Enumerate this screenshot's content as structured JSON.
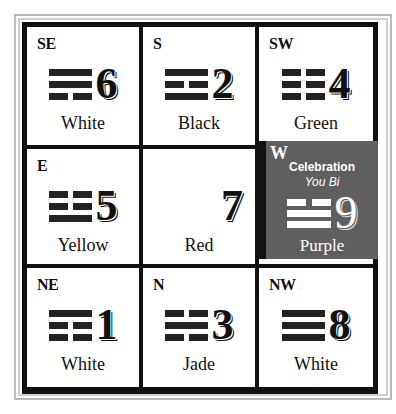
{
  "diagram": {
    "type": "lo-shu-flying-star-grid",
    "cells": [
      {
        "direction": "SE",
        "number": "6",
        "color": "White",
        "trigram": [
          "solid",
          "solid",
          "broken"
        ]
      },
      {
        "direction": "S",
        "number": "2",
        "color": "Black",
        "trigram": [
          "solid",
          "broken",
          "solid"
        ]
      },
      {
        "direction": "SW",
        "number": "4",
        "color": "Green",
        "trigram": [
          "broken",
          "broken",
          "broken"
        ]
      },
      {
        "direction": "E",
        "number": "5",
        "color": "Yellow",
        "trigram": [
          "broken",
          "broken",
          "solid"
        ]
      },
      {
        "direction": "",
        "number": "7",
        "color": "Red",
        "trigram": []
      },
      {
        "direction": "W",
        "number": "9",
        "color": "Purple",
        "trigram": [
          "broken",
          "solid",
          "solid"
        ],
        "title": "Celebration",
        "subtitle": "You Bi",
        "highlighted": true
      },
      {
        "direction": "NE",
        "number": "1",
        "color": "White",
        "trigram": [
          "solid",
          "broken",
          "broken"
        ]
      },
      {
        "direction": "N",
        "number": "3",
        "color": "Jade",
        "trigram": [
          "broken",
          "solid",
          "broken"
        ]
      },
      {
        "direction": "NW",
        "number": "8",
        "color": "White",
        "trigram": [
          "solid",
          "solid",
          "solid"
        ]
      }
    ],
    "colors": {
      "grid_line": "#111111",
      "highlight_bg": "#5f5f5f",
      "frame": "#b9b9b9"
    }
  }
}
